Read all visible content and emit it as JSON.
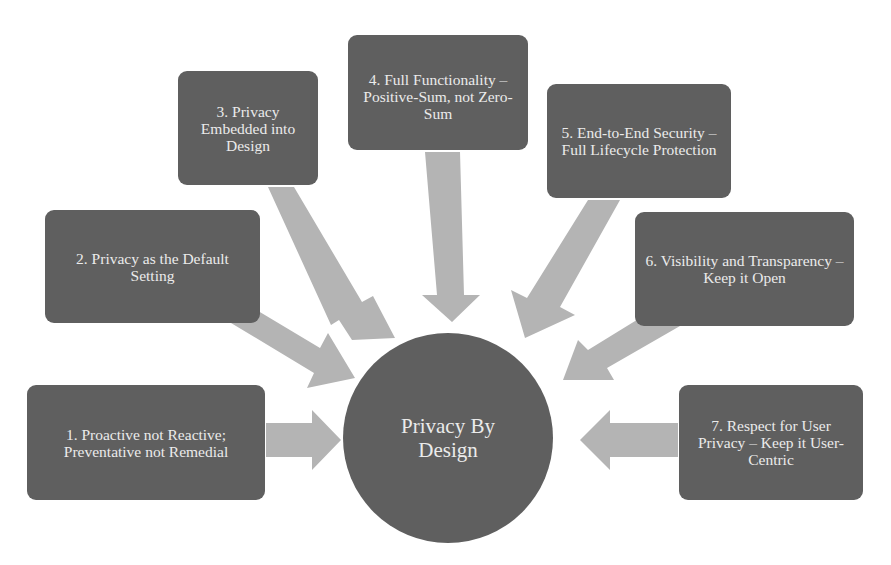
{
  "diagram": {
    "type": "radial-hub",
    "center": {
      "label": "Privacy By Design"
    },
    "principles": [
      {
        "label": "1. Proactive not Reactive; Preventative not Remedial"
      },
      {
        "label": "2. Privacy as the Default Setting"
      },
      {
        "label": "3. Privacy Embedded into Design"
      },
      {
        "label": "4. Full Functionality – Positive-Sum, not Zero-Sum"
      },
      {
        "label": "5. End-to-End Security – Full Lifecycle Protection"
      },
      {
        "label": "6. Visibility and Transparency – Keep it Open"
      },
      {
        "label": "7. Respect for User Privacy – Keep it User-Centric"
      }
    ],
    "colors": {
      "node_fill": "#5f5f5f",
      "node_text": "#ebebeb",
      "arrow_fill": "#b4b4b4",
      "background": "#ffffff"
    }
  }
}
